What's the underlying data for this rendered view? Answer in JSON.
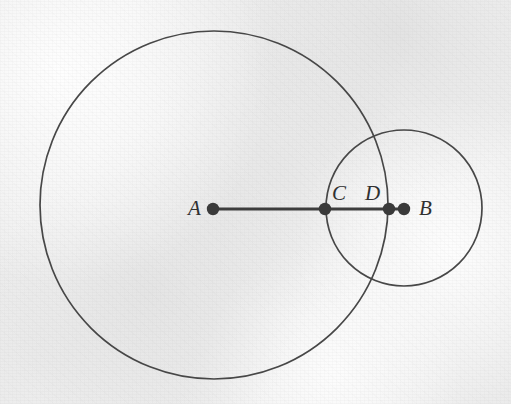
{
  "figure": {
    "width": 511,
    "height": 404,
    "background_color": "#f2f2f2",
    "ink_color": "#3a3a3a",
    "label_color": "#303030",
    "label_font_size_px": 21
  },
  "circles": [
    {
      "name": "large-circle",
      "center_label": "A",
      "cx": 214,
      "cy": 205,
      "r": 174,
      "stroke": "#474747",
      "stroke_width": 1.7
    },
    {
      "name": "small-circle",
      "center_label": "B",
      "cx": 404,
      "cy": 208,
      "r": 78,
      "stroke": "#474747",
      "stroke_width": 1.7
    }
  ],
  "segment": {
    "name": "segment-AB",
    "from": "A",
    "to": "B",
    "x1": 213,
    "y1": 209,
    "x2": 404,
    "y2": 209,
    "stroke": "#3d3d3d",
    "stroke_width": 3.2
  },
  "points": [
    {
      "id": "A",
      "label": "A",
      "cx": 213,
      "cy": 209,
      "r": 6.2,
      "label_x": 188,
      "label_y": 198,
      "description": "center of large circle"
    },
    {
      "id": "C",
      "label": "C",
      "cx": 325,
      "cy": 209,
      "r": 6.2,
      "label_x": 332,
      "label_y": 183,
      "description": "left intersection of small circle with segment"
    },
    {
      "id": "D",
      "label": "D",
      "cx": 389,
      "cy": 209,
      "r": 6.2,
      "label_x": 365,
      "label_y": 183,
      "description": "right edge of large circle on segment"
    },
    {
      "id": "B",
      "label": "B",
      "cx": 404,
      "cy": 209,
      "r": 6.2,
      "label_x": 419,
      "label_y": 198,
      "description": "center of small circle"
    }
  ]
}
